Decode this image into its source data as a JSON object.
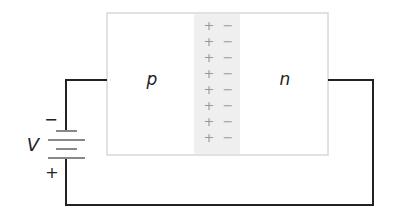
{
  "diagram": {
    "p_region_label": "p",
    "n_region_label": "n",
    "battery_label": "V",
    "battery_negative_sign": "−",
    "battery_positive_sign": "+",
    "depletion_charges": {
      "positive": [
        "+",
        "+",
        "+",
        "+",
        "+",
        "+",
        "+",
        "+"
      ],
      "negative": [
        "−",
        "−",
        "−",
        "−",
        "−",
        "−",
        "−",
        "−"
      ]
    },
    "colors": {
      "wire": "#222222",
      "box_border": "#d8d8d8",
      "depletion_fill": "#efefef",
      "charge_color": "#9a9a9a",
      "label_color": "#222222"
    }
  }
}
